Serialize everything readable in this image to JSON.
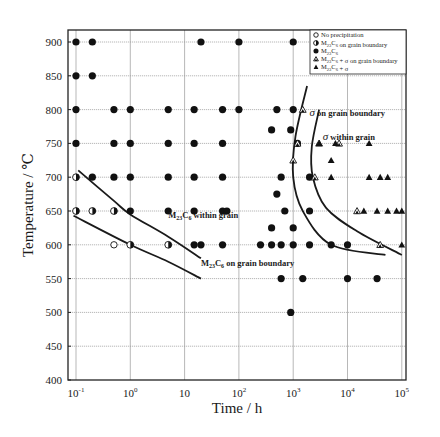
{
  "chart_data": {
    "type": "scatter",
    "title": "",
    "xlabel": "Time / h",
    "ylabel": "Temperature / ℃",
    "xscale": "log",
    "xlim": [
      0.085,
      180000
    ],
    "ylim": [
      400,
      925
    ],
    "grid": true,
    "legend_position": "upper right (inside)",
    "x_tick_labels": [
      "10^-1",
      "10^0",
      "10",
      "10^2",
      "10^3",
      "10^4",
      "10^5"
    ],
    "x_ticks": [
      0.1,
      1,
      10,
      100,
      1000,
      10000,
      100000
    ],
    "y_ticks": [
      400,
      450,
      500,
      550,
      600,
      650,
      700,
      750,
      800,
      850,
      900
    ],
    "legend": [
      {
        "marker": "open-circle",
        "label": "No precipitation"
      },
      {
        "marker": "half-circle",
        "label": "M23C6 on grain boundary"
      },
      {
        "marker": "filled-circle",
        "label": "M23C6"
      },
      {
        "marker": "open-triangle",
        "label": "M23C6 + σ on grain boundary"
      },
      {
        "marker": "filled-triangle",
        "label": "M23C6 + σ"
      }
    ],
    "series": [
      {
        "name": "No precipitation",
        "marker": "open-circle",
        "points": [
          [
            0.5,
            600
          ]
        ]
      },
      {
        "name": "M23C6 on grain boundary",
        "marker": "half-circle",
        "points": [
          [
            0.1,
            700
          ],
          [
            0.1,
            650
          ],
          [
            0.2,
            650
          ],
          [
            0.5,
            650
          ],
          [
            1,
            600
          ],
          [
            5,
            600
          ]
        ]
      },
      {
        "name": "M23C6",
        "marker": "filled-circle",
        "points": [
          [
            0.1,
            900
          ],
          [
            0.2,
            900
          ],
          [
            20,
            900
          ],
          [
            100,
            900
          ],
          [
            1000,
            900
          ],
          [
            0.1,
            850
          ],
          [
            0.2,
            850
          ],
          [
            0.1,
            800
          ],
          [
            0.5,
            800
          ],
          [
            1,
            800
          ],
          [
            5,
            800
          ],
          [
            15,
            800
          ],
          [
            50,
            800
          ],
          [
            100,
            800
          ],
          [
            500,
            800
          ],
          [
            1000,
            800
          ],
          [
            0.1,
            750
          ],
          [
            0.5,
            750
          ],
          [
            1,
            750
          ],
          [
            5,
            750
          ],
          [
            15,
            750
          ],
          [
            50,
            750
          ],
          [
            400,
            770
          ],
          [
            900,
            770
          ],
          [
            1200,
            750
          ],
          [
            0.2,
            700
          ],
          [
            0.5,
            700
          ],
          [
            1,
            700
          ],
          [
            5,
            700
          ],
          [
            15,
            700
          ],
          [
            50,
            700
          ],
          [
            600,
            700
          ],
          [
            2000,
            700
          ],
          [
            1,
            650
          ],
          [
            5,
            650
          ],
          [
            15,
            650
          ],
          [
            50,
            650
          ],
          [
            60,
            650
          ],
          [
            500,
            675
          ],
          [
            700,
            650
          ],
          [
            2000,
            650
          ],
          [
            400,
            625
          ],
          [
            1000,
            625
          ],
          [
            15,
            600
          ],
          [
            20,
            600
          ],
          [
            50,
            600
          ],
          [
            250,
            600
          ],
          [
            400,
            600
          ],
          [
            600,
            600
          ],
          [
            1000,
            600
          ],
          [
            2000,
            600
          ],
          [
            5000,
            600
          ],
          [
            10000,
            600
          ],
          [
            600,
            550
          ],
          [
            1500,
            550
          ],
          [
            10000,
            550
          ],
          [
            35000,
            550
          ],
          [
            900,
            500
          ]
        ]
      },
      {
        "name": "M23C6 + σ on grain boundary",
        "marker": "open-triangle",
        "points": [
          [
            1500,
            800
          ],
          [
            1200,
            750
          ],
          [
            1000,
            725
          ],
          [
            2500,
            700
          ],
          [
            3000,
            750
          ],
          [
            7000,
            750
          ],
          [
            15000,
            650
          ],
          [
            40000,
            600
          ]
        ]
      },
      {
        "name": "M23C6 + σ",
        "marker": "filled-triangle",
        "points": [
          [
            3000,
            750
          ],
          [
            6000,
            750
          ],
          [
            25000,
            750
          ],
          [
            5000,
            725
          ],
          [
            5000,
            700
          ],
          [
            25000,
            700
          ],
          [
            40000,
            700
          ],
          [
            55000,
            700
          ],
          [
            20000,
            650
          ],
          [
            35000,
            650
          ],
          [
            55000,
            650
          ],
          [
            80000,
            650
          ],
          [
            100000,
            650
          ],
          [
            100000,
            600
          ]
        ]
      }
    ],
    "curves": [
      {
        "label": "M23C6 within grain",
        "points": [
          [
            0.11,
            710
          ],
          [
            0.5,
            665
          ],
          [
            1,
            645
          ],
          [
            5,
            612
          ],
          [
            20,
            580
          ]
        ]
      },
      {
        "label": "M23C6 on grain boundary",
        "points": [
          [
            0.09,
            643
          ],
          [
            1,
            600
          ],
          [
            5,
            575
          ],
          [
            20,
            550
          ]
        ]
      },
      {
        "label": "σ on grain boundary",
        "points": [
          [
            1800,
            835
          ],
          [
            1100,
            760
          ],
          [
            1000,
            700
          ],
          [
            1500,
            650
          ],
          [
            5000,
            600
          ],
          [
            50000,
            585
          ]
        ]
      },
      {
        "label": "σ within grain",
        "points": [
          [
            3000,
            800
          ],
          [
            2200,
            745
          ],
          [
            2300,
            700
          ],
          [
            4000,
            655
          ],
          [
            15000,
            620
          ],
          [
            100000,
            585
          ]
        ]
      }
    ],
    "annotations": [
      {
        "text_prefix": "M",
        "sub": "23",
        "mid": "C",
        "sub2": "6",
        "suffix": " within grain",
        "at": [
          5,
          640
        ]
      },
      {
        "text_prefix": "M",
        "sub": "23",
        "mid": "C",
        "sub2": "6",
        "suffix": " on grain boundary",
        "at": [
          20,
          568
        ]
      },
      {
        "sigma": "σ",
        "suffix": " on grain boundary",
        "at": [
          2000,
          790
        ]
      },
      {
        "sigma": "σ",
        "suffix": " within grain",
        "at": [
          3500,
          755
        ]
      }
    ]
  },
  "figure": {
    "xlabel": "Time / h",
    "ylabel": "Temperature / ℃"
  }
}
